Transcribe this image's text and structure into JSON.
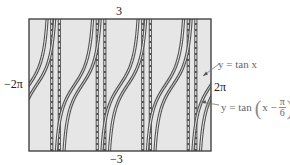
{
  "chart_data": {
    "type": "line",
    "title": "",
    "xlabel": "",
    "ylabel": "",
    "xlim_label": [
      "-2π",
      "2π"
    ],
    "ylim_label": [
      "-3",
      "3"
    ],
    "xlim": [
      -6.2832,
      6.2832
    ],
    "ylim": [
      -3,
      3
    ],
    "grid": false,
    "background": "#e6e6e6",
    "series": [
      {
        "name": "y = tan x",
        "expr": "tan(x)",
        "shift": 0,
        "color": "#555555",
        "style": "double-line"
      },
      {
        "name": "y = tan(x − π/6)",
        "expr": "tan(x - pi/6)",
        "shift": 0.5236,
        "color": "#555555",
        "style": "double-line"
      }
    ],
    "asymptotes_tan": [
      -4.7124,
      -1.5708,
      1.5708,
      4.7124
    ],
    "asymptotes_shifted": [
      -4.1888,
      -1.0472,
      2.0944,
      5.236
    ],
    "annotations": [
      "y = tan x",
      "y = tan(x − π/6)"
    ]
  },
  "labels": {
    "y_top": "3",
    "y_bottom": "−3",
    "x_left": "−2π",
    "x_right": "2π",
    "legend_tan": "y = tan x",
    "legend_shift_prefix": "y = tan",
    "legend_shift_x": "x −",
    "legend_shift_num": "π",
    "legend_shift_den": "6"
  }
}
